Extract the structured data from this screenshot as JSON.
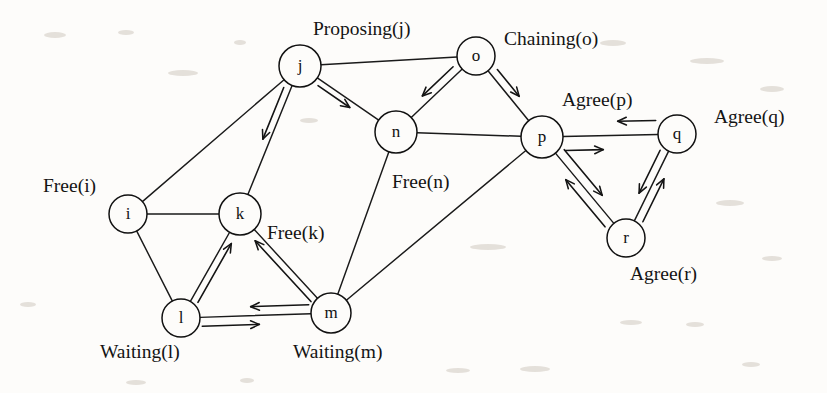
{
  "figure": {
    "kind": "state-graph",
    "background_color": "#fdfcfa",
    "stroke_color": "#111111",
    "node_radius": 20
  },
  "nodes": [
    {
      "id": "i",
      "label": "i",
      "cx": 128,
      "cy": 214,
      "r": 19
    },
    {
      "id": "j",
      "label": "j",
      "cx": 300,
      "cy": 66,
      "r": 21
    },
    {
      "id": "k",
      "label": "k",
      "cx": 240,
      "cy": 214,
      "r": 21
    },
    {
      "id": "l",
      "label": "l",
      "cx": 181,
      "cy": 318,
      "r": 19
    },
    {
      "id": "m",
      "label": "m",
      "cx": 331,
      "cy": 313,
      "r": 20
    },
    {
      "id": "n",
      "label": "n",
      "cx": 396,
      "cy": 132,
      "r": 21
    },
    {
      "id": "o",
      "label": "o",
      "cx": 476,
      "cy": 56,
      "r": 19
    },
    {
      "id": "p",
      "label": "p",
      "cx": 542,
      "cy": 137,
      "r": 21
    },
    {
      "id": "q",
      "label": "q",
      "cx": 677,
      "cy": 134,
      "r": 19
    },
    {
      "id": "r",
      "label": "r",
      "cx": 626,
      "cy": 238,
      "r": 19
    }
  ],
  "edges": [
    {
      "from": "i",
      "to": "j",
      "directed": false
    },
    {
      "from": "i",
      "to": "k",
      "directed": false
    },
    {
      "from": "i",
      "to": "l",
      "directed": false
    },
    {
      "from": "j",
      "to": "k",
      "directed": false
    },
    {
      "from": "j",
      "to": "n",
      "directed": false
    },
    {
      "from": "j",
      "to": "o",
      "directed": false
    },
    {
      "from": "k",
      "to": "l",
      "directed": false
    },
    {
      "from": "k",
      "to": "m",
      "directed": false
    },
    {
      "from": "l",
      "to": "m",
      "directed": false
    },
    {
      "from": "n",
      "to": "o",
      "directed": false
    },
    {
      "from": "n",
      "to": "m",
      "directed": false
    },
    {
      "from": "n",
      "to": "p",
      "directed": false
    },
    {
      "from": "o",
      "to": "p",
      "directed": false
    },
    {
      "from": "p",
      "to": "m",
      "directed": false
    },
    {
      "from": "p",
      "to": "q",
      "directed": false
    },
    {
      "from": "p",
      "to": "r",
      "directed": false
    },
    {
      "from": "q",
      "to": "r",
      "directed": false
    }
  ],
  "arrows": [
    {
      "from": "j",
      "to": "k",
      "offset": 7,
      "start_gap": 26,
      "end_gap": 78,
      "note": "j requests k"
    },
    {
      "from": "j",
      "to": "n",
      "offset": 6,
      "start_gap": 26,
      "end_gap": 52,
      "note": "j requests n"
    },
    {
      "from": "o",
      "to": "n",
      "offset": 8,
      "start_gap": 24,
      "end_gap": 44,
      "note": "o requests n"
    },
    {
      "from": "o",
      "to": "p",
      "offset": -8,
      "start_gap": 24,
      "end_gap": 46,
      "note": "o requests p"
    },
    {
      "from": "l",
      "to": "k",
      "offset": 7,
      "start_gap": 22,
      "end_gap": 30,
      "note": "l waits on k"
    },
    {
      "from": "m",
      "to": "k",
      "offset": -7,
      "start_gap": 22,
      "end_gap": 30,
      "note": "m waits on k"
    },
    {
      "from": "l",
      "to": "m",
      "offset": 9,
      "start_gap": 21,
      "end_gap": 72,
      "note": "l to m"
    },
    {
      "from": "m",
      "to": "l",
      "offset": 9,
      "start_gap": 22,
      "end_gap": 70,
      "note": "m to l"
    },
    {
      "from": "p",
      "to": "q",
      "offset": 14,
      "start_gap": 23,
      "end_gap": 74,
      "note": "p to q"
    },
    {
      "from": "q",
      "to": "p",
      "offset": 14,
      "start_gap": 21,
      "end_gap": 76,
      "note": "q to p"
    },
    {
      "from": "p",
      "to": "r",
      "offset": -9,
      "start_gap": 24,
      "end_gap": 48,
      "note": "p to r"
    },
    {
      "from": "r",
      "to": "p",
      "offset": -9,
      "start_gap": 22,
      "end_gap": 48,
      "note": "r to p"
    },
    {
      "from": "q",
      "to": "r",
      "offset": 8,
      "start_gap": 22,
      "end_gap": 46,
      "note": "q to r"
    },
    {
      "from": "r",
      "to": "q",
      "offset": 8,
      "start_gap": 22,
      "end_gap": 46,
      "note": "r to q"
    }
  ],
  "state_labels": [
    {
      "id": "free-i",
      "text": "Free(i)",
      "x": 43,
      "y": 192,
      "anchor": "start"
    },
    {
      "id": "proposing-j",
      "text": "Proposing(j)",
      "x": 313,
      "y": 35,
      "anchor": "start"
    },
    {
      "id": "chaining-o",
      "text": "Chaining(o)",
      "x": 504,
      "y": 45,
      "anchor": "start"
    },
    {
      "id": "agree-p",
      "text": "Agree(p)",
      "x": 562,
      "y": 106,
      "anchor": "start"
    },
    {
      "id": "agree-q",
      "text": "Agree(q)",
      "x": 714,
      "y": 123,
      "anchor": "start"
    },
    {
      "id": "free-n",
      "text": "Free(n)",
      "x": 392,
      "y": 188,
      "anchor": "start"
    },
    {
      "id": "free-k",
      "text": "Free(k)",
      "x": 267,
      "y": 239,
      "anchor": "start"
    },
    {
      "id": "agree-r",
      "text": "Agree(r)",
      "x": 630,
      "y": 280,
      "anchor": "start"
    },
    {
      "id": "waiting-l",
      "text": "Waiting(l)",
      "x": 100,
      "y": 358,
      "anchor": "start"
    },
    {
      "id": "waiting-m",
      "text": "Waiting(m)",
      "x": 293,
      "y": 358,
      "anchor": "start"
    }
  ],
  "specks": [
    {
      "x": 44,
      "y": 32,
      "w": 22,
      "h": 6
    },
    {
      "x": 118,
      "y": 30,
      "w": 16,
      "h": 5
    },
    {
      "x": 168,
      "y": 70,
      "w": 30,
      "h": 6
    },
    {
      "x": 234,
      "y": 40,
      "w": 12,
      "h": 5
    },
    {
      "x": 300,
      "y": 118,
      "w": 18,
      "h": 5
    },
    {
      "x": 600,
      "y": 40,
      "w": 26,
      "h": 6
    },
    {
      "x": 690,
      "y": 58,
      "w": 34,
      "h": 6
    },
    {
      "x": 760,
      "y": 86,
      "w": 24,
      "h": 6
    },
    {
      "x": 716,
      "y": 200,
      "w": 28,
      "h": 6
    },
    {
      "x": 470,
      "y": 244,
      "w": 36,
      "h": 6
    },
    {
      "x": 762,
      "y": 256,
      "w": 20,
      "h": 5
    },
    {
      "x": 620,
      "y": 320,
      "w": 22,
      "h": 5
    },
    {
      "x": 686,
      "y": 322,
      "w": 18,
      "h": 5
    },
    {
      "x": 20,
      "y": 302,
      "w": 16,
      "h": 5
    },
    {
      "x": 446,
      "y": 368,
      "w": 24,
      "h": 5
    },
    {
      "x": 520,
      "y": 366,
      "w": 30,
      "h": 6
    },
    {
      "x": 126,
      "y": 380,
      "w": 20,
      "h": 5
    },
    {
      "x": 240,
      "y": 378,
      "w": 14,
      "h": 5
    },
    {
      "x": 742,
      "y": 362,
      "w": 18,
      "h": 5
    }
  ]
}
